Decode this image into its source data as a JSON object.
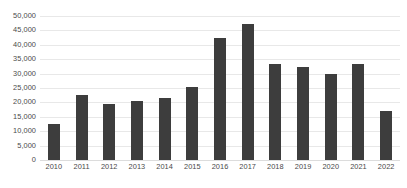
{
  "chart_data": {
    "type": "bar",
    "title": "",
    "subtitle": "",
    "xlabel": "",
    "ylabel": "",
    "categories": [
      "2010",
      "2011",
      "2012",
      "2013",
      "2014",
      "2015",
      "2016",
      "2017",
      "2018",
      "2019",
      "2020",
      "2021",
      "2022"
    ],
    "values": [
      12600,
      22500,
      19400,
      20500,
      21600,
      25200,
      42500,
      47400,
      33500,
      32200,
      30000,
      33500,
      16900
    ],
    "series": [
      {
        "name": "",
        "values": [
          12600,
          22500,
          19400,
          20500,
          21600,
          25200,
          42500,
          47400,
          33500,
          32200,
          30000,
          33500,
          16900
        ]
      }
    ],
    "ylim": [
      0,
      50000
    ],
    "ytick_values": [
      0,
      5000,
      10000,
      15000,
      20000,
      25000,
      30000,
      35000,
      40000,
      45000,
      50000
    ],
    "ytick_labels": [
      "0",
      "5,000",
      "10,000",
      "15,000",
      "20,000",
      "25,000",
      "30,000",
      "35,000",
      "40,000",
      "45,000",
      "50,000"
    ],
    "grid": true,
    "grid_axis": "y",
    "legend": false,
    "legend_position": "none",
    "bar_color": "#3d3d3d",
    "gridline_color": "#e8e8e8",
    "axis_text_color": "#4a4a4a",
    "background_color": "#ffffff",
    "annotations": []
  }
}
